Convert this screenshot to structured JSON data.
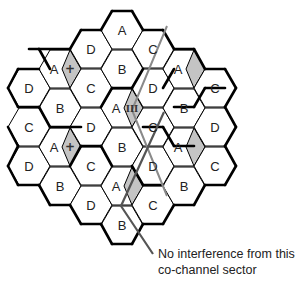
{
  "diagram": {
    "title": "",
    "hex": {
      "half_width": 21,
      "half_height": 19,
      "top_half": 10
    },
    "colors": {
      "cell_fill": "#ffffff",
      "cell_stroke": "#000000",
      "sector_fill": "#c4c4c4",
      "line_light": "#8a8a8a",
      "line_dark": "#555555",
      "text": "#222222"
    },
    "cells": [
      {
        "x": 29,
        "y": 88,
        "label": "D"
      },
      {
        "x": 29,
        "y": 127,
        "label": "C"
      },
      {
        "x": 29,
        "y": 166,
        "label": "D"
      },
      {
        "x": 60,
        "y": 69,
        "label": "A",
        "sector": true,
        "mark": "+"
      },
      {
        "x": 60,
        "y": 108,
        "label": "B"
      },
      {
        "x": 60,
        "y": 147,
        "label": "A",
        "sector": true,
        "mark": "+"
      },
      {
        "x": 60,
        "y": 186,
        "label": "B"
      },
      {
        "x": 91,
        "y": 49,
        "label": "D"
      },
      {
        "x": 91,
        "y": 88,
        "label": "C"
      },
      {
        "x": 91,
        "y": 127,
        "label": "D"
      },
      {
        "x": 91,
        "y": 166,
        "label": "C"
      },
      {
        "x": 91,
        "y": 205,
        "label": "D"
      },
      {
        "x": 122,
        "y": 30,
        "label": "A"
      },
      {
        "x": 122,
        "y": 69,
        "label": "B"
      },
      {
        "x": 122,
        "y": 108,
        "label": "A",
        "sector": true,
        "mark": "III"
      },
      {
        "x": 122,
        "y": 147,
        "label": "B"
      },
      {
        "x": 122,
        "y": 186,
        "label": "A",
        "sector": true,
        "mark": ""
      },
      {
        "x": 122,
        "y": 225,
        "label": "B"
      },
      {
        "x": 153,
        "y": 49,
        "label": "C"
      },
      {
        "x": 153,
        "y": 88,
        "label": "D"
      },
      {
        "x": 153,
        "y": 127,
        "label": "C"
      },
      {
        "x": 153,
        "y": 166,
        "label": "D"
      },
      {
        "x": 153,
        "y": 205,
        "label": "C"
      },
      {
        "x": 184,
        "y": 69,
        "label": "A",
        "sector": true,
        "mark": ""
      },
      {
        "x": 184,
        "y": 108,
        "label": "B"
      },
      {
        "x": 184,
        "y": 147,
        "label": "A",
        "sector": true,
        "mark": ""
      },
      {
        "x": 184,
        "y": 186,
        "label": "B"
      },
      {
        "x": 215,
        "y": 88,
        "label": "C"
      },
      {
        "x": 215,
        "y": 127,
        "label": "D"
      },
      {
        "x": 215,
        "y": 166,
        "label": "C"
      }
    ],
    "thick_edges": [
      [
        112,
        11,
        132,
        11
      ],
      [
        132,
        11,
        143,
        30
      ],
      [
        101,
        30,
        112,
        11
      ],
      [
        81,
        30,
        101,
        30
      ],
      [
        70,
        49,
        81,
        30
      ],
      [
        143,
        30,
        163,
        30
      ],
      [
        163,
        30,
        174,
        49
      ],
      [
        39,
        49,
        70,
        49
      ],
      [
        39,
        49,
        50,
        69
      ],
      [
        29,
        49,
        39,
        49
      ],
      [
        174,
        49,
        194,
        49
      ],
      [
        194,
        49,
        205,
        69
      ],
      [
        205,
        69,
        225,
        69
      ],
      [
        225,
        69,
        236,
        88
      ],
      [
        236,
        88,
        225,
        107
      ],
      [
        8,
        88,
        18,
        69
      ],
      [
        18,
        69,
        39,
        69
      ],
      [
        8,
        88,
        18,
        107
      ],
      [
        18,
        107,
        39,
        107
      ],
      [
        39,
        107,
        50,
        127
      ],
      [
        50,
        127,
        81,
        127
      ],
      [
        8,
        127,
        18,
        146
      ],
      [
        18,
        146,
        8,
        166
      ],
      [
        8,
        166,
        18,
        185
      ],
      [
        18,
        185,
        39,
        185
      ],
      [
        39,
        185,
        50,
        205
      ],
      [
        50,
        205,
        70,
        205
      ],
      [
        70,
        205,
        81,
        224
      ],
      [
        81,
        224,
        101,
        224
      ],
      [
        101,
        224,
        112,
        244
      ],
      [
        112,
        244,
        132,
        244
      ],
      [
        132,
        244,
        143,
        224
      ],
      [
        143,
        224,
        163,
        224
      ],
      [
        163,
        224,
        174,
        205
      ],
      [
        174,
        205,
        194,
        205
      ],
      [
        194,
        205,
        205,
        185
      ],
      [
        205,
        185,
        225,
        185
      ],
      [
        225,
        185,
        236,
        166
      ],
      [
        236,
        166,
        225,
        146
      ],
      [
        225,
        146,
        236,
        127
      ],
      [
        236,
        127,
        225,
        107
      ],
      [
        101,
        107,
        112,
        88
      ],
      [
        112,
        88,
        132,
        88
      ],
      [
        132,
        88,
        143,
        69
      ],
      [
        143,
        127,
        163,
        127
      ],
      [
        163,
        127,
        174,
        146
      ],
      [
        174,
        146,
        194,
        146
      ],
      [
        70,
        166,
        81,
        146
      ],
      [
        81,
        146,
        101,
        146
      ],
      [
        101,
        146,
        112,
        166
      ],
      [
        132,
        166,
        143,
        185
      ],
      [
        143,
        185,
        163,
        185
      ],
      [
        163,
        88,
        174,
        69
      ],
      [
        174,
        107,
        194,
        107
      ],
      [
        194,
        107,
        205,
        88
      ],
      [
        205,
        88,
        225,
        88
      ]
    ],
    "lines": [
      {
        "id": "interference-path-1",
        "tone": "line_light",
        "width": 2,
        "points": [
          [
            167,
            26
          ],
          [
            132,
            110
          ],
          [
            167,
            196
          ]
        ]
      },
      {
        "id": "interference-path-2",
        "tone": "line_dark",
        "width": 2.2,
        "points": [
          [
            164,
            112
          ],
          [
            121,
            206
          ],
          [
            153,
            254
          ]
        ]
      }
    ],
    "caption": {
      "line1": "No interference from this",
      "line2": "co-channel sector"
    }
  }
}
